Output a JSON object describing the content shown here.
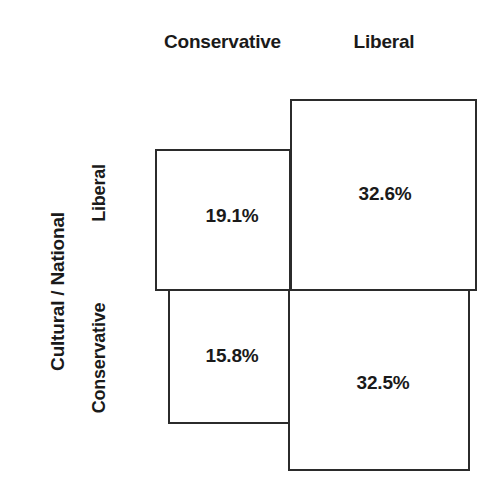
{
  "figure": {
    "type": "mosaic-plot",
    "width": 497,
    "height": 502,
    "background_color": "#ffffff",
    "line_color": "#2b2b2b",
    "text_color": "#1a1a1a"
  },
  "x_axis": {
    "title": "",
    "categories": [
      "Conservative",
      "Liberal"
    ]
  },
  "y_axis": {
    "title": "Cultural / National",
    "categories": [
      "Liberal",
      "Conservative"
    ]
  },
  "cells": {
    "conservative_liberal": "19.1%",
    "liberal_liberal": "32.6%",
    "conservative_conservative": "15.8%",
    "liberal_conservative": "32.5%"
  },
  "chart_data": {
    "type": "heatmap",
    "subtype": "mosaic",
    "title": "",
    "xlabel": "",
    "ylabel": "Cultural / National",
    "x_categories": [
      "Conservative",
      "Liberal"
    ],
    "y_categories": [
      "Liberal",
      "Conservative"
    ],
    "grid": false,
    "legend": "none",
    "value_unit": "percent",
    "values": [
      [
        19.1,
        32.6
      ],
      [
        15.8,
        32.5
      ]
    ],
    "labels": [
      [
        "19.1%",
        "32.6%"
      ],
      [
        "15.8%",
        "32.5%"
      ]
    ],
    "cells": [
      {
        "row": "Liberal",
        "column": "Conservative",
        "value": 19.1,
        "label": "19.1%"
      },
      {
        "row": "Liberal",
        "column": "Liberal",
        "value": 32.6,
        "label": "32.6%"
      },
      {
        "row": "Conservative",
        "column": "Conservative",
        "value": 15.8,
        "label": "15.8%"
      },
      {
        "row": "Conservative",
        "column": "Liberal",
        "value": 32.5,
        "label": "32.5%"
      }
    ],
    "row_totals": [
      51.7,
      48.3
    ],
    "column_totals": [
      34.9,
      65.1
    ],
    "total": 100.0
  }
}
